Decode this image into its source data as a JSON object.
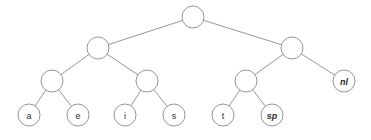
{
  "figure": {
    "type": "binary-tree-diagram",
    "background_color": "#ffffff",
    "stroke_color": "#8a8a8a",
    "label_color": "#2b2b2b"
  },
  "chart_data": {
    "type": "diagram",
    "title": "",
    "nodes": [
      {
        "id": "root",
        "label": "",
        "italic": false,
        "cx": 193,
        "cy": 17,
        "r": 11,
        "level": 0,
        "leaf": false
      },
      {
        "id": "n-l",
        "label": "",
        "italic": false,
        "cx": 98,
        "cy": 48,
        "r": 11,
        "level": 1,
        "leaf": false
      },
      {
        "id": "n-r",
        "label": "",
        "italic": false,
        "cx": 292,
        "cy": 48,
        "r": 11,
        "level": 1,
        "leaf": false
      },
      {
        "id": "n-ll",
        "label": "",
        "italic": false,
        "cx": 52,
        "cy": 81,
        "r": 11,
        "level": 2,
        "leaf": false
      },
      {
        "id": "n-lr",
        "label": "",
        "italic": false,
        "cx": 147,
        "cy": 81,
        "r": 11,
        "level": 2,
        "leaf": false
      },
      {
        "id": "n-rl",
        "label": "",
        "italic": false,
        "cx": 246,
        "cy": 81,
        "r": 11,
        "level": 2,
        "leaf": false
      },
      {
        "id": "leaf-nl",
        "label": "nl",
        "italic": true,
        "cx": 344,
        "cy": 81,
        "r": 11,
        "level": 2,
        "leaf": true
      },
      {
        "id": "leaf-a",
        "label": "a",
        "italic": false,
        "cx": 29,
        "cy": 115,
        "r": 11,
        "level": 3,
        "leaf": true
      },
      {
        "id": "leaf-e",
        "label": "e",
        "italic": false,
        "cx": 78,
        "cy": 115,
        "r": 11,
        "level": 3,
        "leaf": true
      },
      {
        "id": "leaf-i",
        "label": "i",
        "italic": false,
        "cx": 125,
        "cy": 115,
        "r": 11,
        "level": 3,
        "leaf": true
      },
      {
        "id": "leaf-s",
        "label": "s",
        "italic": false,
        "cx": 174,
        "cy": 115,
        "r": 11,
        "level": 3,
        "leaf": true
      },
      {
        "id": "leaf-t",
        "label": "t",
        "italic": false,
        "cx": 223,
        "cy": 115,
        "r": 11,
        "level": 3,
        "leaf": true
      },
      {
        "id": "leaf-sp",
        "label": "sp",
        "italic": true,
        "cx": 272,
        "cy": 115,
        "r": 11,
        "level": 3,
        "leaf": true
      }
    ],
    "edges": [
      {
        "from": "root",
        "to": "n-l"
      },
      {
        "from": "root",
        "to": "n-r"
      },
      {
        "from": "n-l",
        "to": "n-ll"
      },
      {
        "from": "n-l",
        "to": "n-lr"
      },
      {
        "from": "n-r",
        "to": "n-rl"
      },
      {
        "from": "n-r",
        "to": "leaf-nl"
      },
      {
        "from": "n-ll",
        "to": "leaf-a"
      },
      {
        "from": "n-ll",
        "to": "leaf-e"
      },
      {
        "from": "n-lr",
        "to": "leaf-i"
      },
      {
        "from": "n-lr",
        "to": "leaf-s"
      },
      {
        "from": "n-rl",
        "to": "leaf-t"
      },
      {
        "from": "n-rl",
        "to": "leaf-sp"
      }
    ],
    "leaf_labels": [
      "a",
      "e",
      "i",
      "s",
      "t",
      "sp",
      "nl"
    ]
  }
}
